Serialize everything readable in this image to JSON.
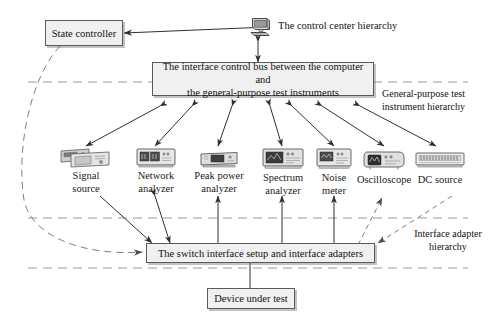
{
  "diagram": {
    "title_nodes": {
      "state_controller": "State controller",
      "control_center": "The control center hierarchy",
      "interface_bus_line1": "The interface control bus between the computer and",
      "interface_bus_line2": "the general-purpose test instruments",
      "switch_interface": "The switch interface setup and interface adapters",
      "device_under_test": "Device under test"
    },
    "hierarchy_labels": {
      "general_purpose_line1": "General-purpose test",
      "general_purpose_line2": "instrument hierarchy",
      "interface_adapter_line1": "Interface adapter",
      "interface_adapter_line2": "hierarchy"
    },
    "instruments": [
      {
        "icon": "signal-source-icon",
        "line1": "Signal",
        "line2": "source"
      },
      {
        "icon": "network-analyzer-icon",
        "line1": "Network",
        "line2": "analyzer"
      },
      {
        "icon": "peak-power-analyzer-icon",
        "line1": "Peak power",
        "line2": "analyzer"
      },
      {
        "icon": "spectrum-analyzer-icon",
        "line1": "Spectrum",
        "line2": "analyzer"
      },
      {
        "icon": "noise-meter-icon",
        "line1": "Noise",
        "line2": "meter"
      },
      {
        "icon": "oscilloscope-icon",
        "line1": "Oscilloscope",
        "line2": ""
      },
      {
        "icon": "dc-source-icon",
        "line1": "DC source",
        "line2": ""
      }
    ],
    "computer_icon": "desktop-computer-icon",
    "colors": {
      "box_fill": "#f0f0f0",
      "box_border": "#5a5a5a",
      "line": "#3b3b3b",
      "dashed_line": "#8a8a8a",
      "text": "#111111",
      "background": "#ffffff"
    }
  }
}
